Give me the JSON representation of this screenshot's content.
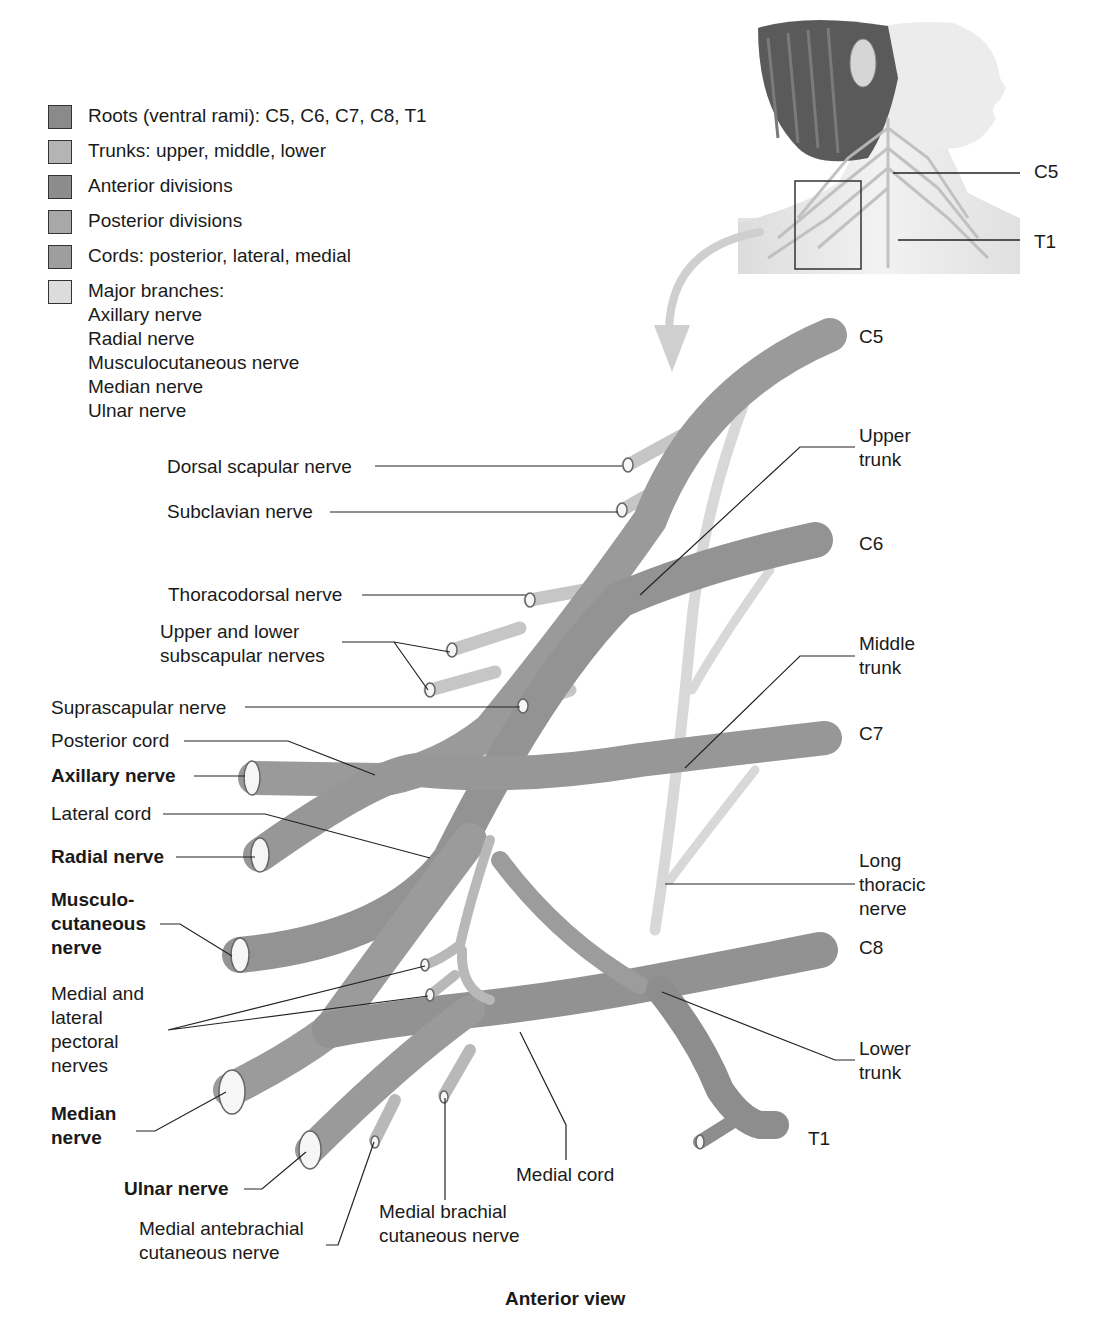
{
  "legend": {
    "items": [
      {
        "label": "Roots (ventral rami): C5, C6, C7, C8, T1",
        "color": "#8a8a8a"
      },
      {
        "label": "Trunks: upper, middle, lower",
        "color": "#b4b4b4"
      },
      {
        "label": "Anterior divisions",
        "color": "#8c8c8c"
      },
      {
        "label": "Posterior divisions",
        "color": "#a8a8a8"
      },
      {
        "label": "Cords: posterior, lateral, medial",
        "color": "#9e9e9e"
      },
      {
        "label": "Major branches:",
        "color": "#dcdcdc"
      }
    ],
    "major_branches": [
      "Axillary nerve",
      "Radial nerve",
      "Musculocutaneous nerve",
      "Median nerve",
      "Ulnar nerve"
    ]
  },
  "inset": {
    "labels": {
      "c5": "C5",
      "t1": "T1"
    }
  },
  "roots": {
    "c5": "C5",
    "c6": "C6",
    "c7": "C7",
    "c8": "C8",
    "t1": "T1"
  },
  "labels": {
    "dorsal_scapular": "Dorsal scapular nerve",
    "subclavian": "Subclavian nerve",
    "thoracodorsal": "Thoracodorsal nerve",
    "subscapular": "Upper and lower\nsubscapular nerves",
    "suprascapular": "Suprascapular nerve",
    "posterior_cord": "Posterior cord",
    "axillary": "Axillary nerve",
    "lateral_cord": "Lateral cord",
    "radial": "Radial nerve",
    "musculocutaneous": "Musculo-\ncutaneous\nnerve",
    "pectoral": "Medial and\nlateral\npectoral\nnerves",
    "median": "Median\nnerve",
    "ulnar": "Ulnar nerve",
    "med_antebrachial": "Medial antebrachial\ncutaneous nerve",
    "med_brachial": "Medial brachial\ncutaneous nerve",
    "medial_cord": "Medial cord",
    "upper_trunk": "Upper\ntrunk",
    "middle_trunk": "Middle\ntrunk",
    "long_thoracic": "Long\nthoracic\nnerve",
    "lower_trunk": "Lower\ntrunk"
  },
  "caption": "Anterior view",
  "colors": {
    "root": "#8a8a8a",
    "trunk": "#a9a9a9",
    "division": "#9a9a9a",
    "cord": "#a0a0a0",
    "branch": "#c8c8c8",
    "long_thoracic": "#d8d8d8",
    "arrow": "#cfcfcf"
  }
}
